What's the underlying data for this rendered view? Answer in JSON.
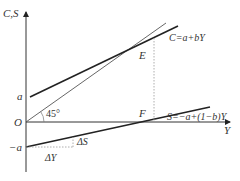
{
  "diagram": {
    "type": "economics-consumption-saving-function",
    "axes": {
      "y_label": "C,S",
      "x_label": "Y",
      "origin_label": "O"
    },
    "intercepts": {
      "a_label": "a",
      "neg_a_label": "−a"
    },
    "lines": {
      "consumption": {
        "label": "C=a+bY"
      },
      "saving": {
        "label": "S=−a+(1−b)Y"
      },
      "diagonal": {
        "label": "45°"
      }
    },
    "points": {
      "E": "E",
      "F": "F"
    },
    "increments": {
      "delta_y": "ΔY",
      "delta_s": "ΔS"
    },
    "colors": {
      "line": "#222222",
      "guide": "#999999"
    }
  }
}
